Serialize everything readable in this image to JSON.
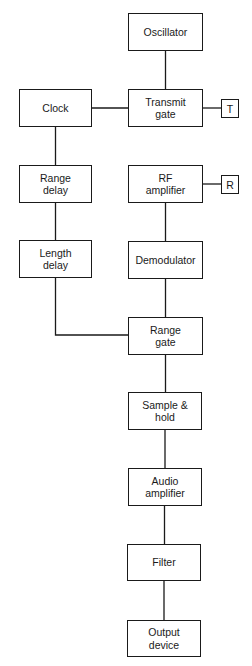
{
  "diagram": {
    "title": "",
    "colors": {
      "line": "#1a1a1a",
      "background": "#ffffff"
    },
    "blocks": [
      {
        "id": "oscillator",
        "label": "Oscillator",
        "x": 128,
        "y": 13,
        "w": 75,
        "h": 38
      },
      {
        "id": "clock",
        "label": "Clock",
        "x": 19,
        "y": 89,
        "w": 73,
        "h": 38
      },
      {
        "id": "transmit_gate",
        "label": "Transmit\ngate",
        "x": 128,
        "y": 89,
        "w": 75,
        "h": 38
      },
      {
        "id": "range_delay",
        "label": "Range\ndelay",
        "x": 19,
        "y": 165,
        "w": 73,
        "h": 38
      },
      {
        "id": "rf_amplifier",
        "label": "RF\namplifier",
        "x": 128,
        "y": 165,
        "w": 75,
        "h": 38
      },
      {
        "id": "length_delay",
        "label": "Length\ndelay",
        "x": 19,
        "y": 240,
        "w": 73,
        "h": 38
      },
      {
        "id": "demodulator",
        "label": "Demodulator",
        "x": 128,
        "y": 241,
        "w": 75,
        "h": 38
      },
      {
        "id": "range_gate",
        "label": "Range\ngate",
        "x": 128,
        "y": 317,
        "w": 75,
        "h": 38
      },
      {
        "id": "sample_hold",
        "label": "Sample &\nhold",
        "x": 128,
        "y": 392,
        "w": 74,
        "h": 38
      },
      {
        "id": "audio_amplifier",
        "label": "Audio\namplifier",
        "x": 128,
        "y": 468,
        "w": 74,
        "h": 38
      },
      {
        "id": "filter",
        "label": "Filter",
        "x": 127,
        "y": 544,
        "w": 74,
        "h": 37
      },
      {
        "id": "output_device",
        "label": "Output\ndevice",
        "x": 127,
        "y": 620,
        "w": 74,
        "h": 37
      }
    ],
    "terminals": [
      {
        "id": "T",
        "label": "T",
        "x": 221,
        "y": 99,
        "w": 18,
        "h": 19,
        "attached_to": "transmit_gate"
      },
      {
        "id": "R",
        "label": "R",
        "x": 221,
        "y": 175,
        "w": 18,
        "h": 19,
        "attached_to": "rf_amplifier"
      }
    ],
    "connections": [
      [
        "oscillator",
        "transmit_gate"
      ],
      [
        "clock",
        "transmit_gate"
      ],
      [
        "transmit_gate",
        "T"
      ],
      [
        "clock",
        "range_delay"
      ],
      [
        "range_delay",
        "length_delay"
      ],
      [
        "rf_amplifier",
        "R"
      ],
      [
        "rf_amplifier",
        "demodulator"
      ],
      [
        "demodulator",
        "range_gate"
      ],
      [
        "length_delay",
        "range_gate"
      ],
      [
        "range_gate",
        "sample_hold"
      ],
      [
        "sample_hold",
        "audio_amplifier"
      ],
      [
        "audio_amplifier",
        "filter"
      ],
      [
        "filter",
        "output_device"
      ]
    ]
  }
}
